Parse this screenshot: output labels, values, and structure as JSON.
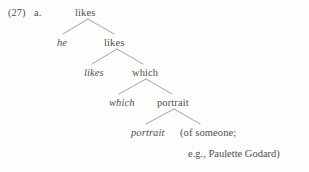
{
  "page": {
    "background_color": "#fdfdfc",
    "ink_color": "#4f4f4f",
    "branch_color": "#8a8a8a"
  },
  "example": {
    "number": "(27)",
    "letter": "a."
  },
  "tree": {
    "description": "syntactic derivation tree showing successive-cyclic movement",
    "nodes": [
      {
        "id": "n0",
        "label": "likes",
        "style": "roman",
        "x": 75,
        "y": 7,
        "level": 0
      },
      {
        "id": "n1",
        "label": "he",
        "style": "italic",
        "x": 57,
        "y": 37,
        "level": 1
      },
      {
        "id": "n2",
        "label": "likes",
        "style": "roman",
        "x": 104,
        "y": 37,
        "level": 1
      },
      {
        "id": "n3",
        "label": "likes",
        "style": "italic",
        "x": 84,
        "y": 67,
        "level": 2
      },
      {
        "id": "n4",
        "label": "which",
        "style": "roman",
        "x": 132,
        "y": 67,
        "level": 2
      },
      {
        "id": "n5",
        "label": "which",
        "style": "italic",
        "x": 109,
        "y": 97,
        "level": 3
      },
      {
        "id": "n6",
        "label": "portrait",
        "style": "roman",
        "x": 157,
        "y": 97,
        "level": 3
      },
      {
        "id": "n7",
        "label": "portrait",
        "style": "italic",
        "x": 131,
        "y": 127,
        "level": 4
      },
      {
        "id": "n8",
        "label": "(of someone;",
        "style": "roman",
        "x": 180,
        "y": 127,
        "level": 4
      }
    ],
    "branches": [
      {
        "id": "b0",
        "apex_x": 88,
        "apex_y": 19,
        "left_x": 63,
        "left_y": 34,
        "right_x": 114,
        "right_y": 34
      },
      {
        "id": "b1",
        "apex_x": 117,
        "apex_y": 49,
        "left_x": 92,
        "left_y": 64,
        "right_x": 143,
        "right_y": 64
      },
      {
        "id": "b2",
        "apex_x": 146,
        "apex_y": 79,
        "left_x": 119,
        "left_y": 94,
        "right_x": 172,
        "right_y": 94
      },
      {
        "id": "b3",
        "apex_x": 174,
        "apex_y": 109,
        "left_x": 146,
        "left_y": 124,
        "right_x": 200,
        "right_y": 124
      }
    ]
  },
  "continuation": {
    "line": "e.g., Paulette Godard)"
  }
}
